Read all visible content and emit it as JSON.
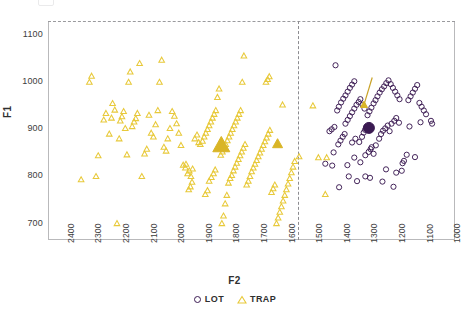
{
  "chart_data": {
    "type": "scatter",
    "title": "",
    "xlabel": "F2",
    "ylabel": "F1",
    "xlim": [
      2450,
      975
    ],
    "ylim": [
      1130,
      665
    ],
    "x_inverted": true,
    "y_inverted": true,
    "grid": false,
    "legend_position": "bottom-center",
    "xticks": [
      2400,
      2300,
      2200,
      2100,
      2000,
      1900,
      1800,
      1700,
      1600,
      1500,
      1400,
      1300,
      1200,
      1100,
      1000
    ],
    "yticks": [
      700,
      800,
      900,
      1000,
      1100
    ],
    "annotations": [
      {
        "name": "vertical-divider",
        "type": "vline",
        "x": 1545,
        "style": "dashed"
      },
      {
        "name": "centroid-arrow",
        "type": "arrow",
        "from": [
          1275,
          1010
        ],
        "to": [
          1305,
          952
        ],
        "color": "#C9A227"
      }
    ],
    "series": [
      {
        "name": "LOT",
        "marker": "circle-open",
        "color": "#3B1A52",
        "points": [
          [
            1395,
            777
          ],
          [
            1330,
            790
          ],
          [
            1360,
            800
          ],
          [
            1420,
            823
          ],
          [
            1445,
            827
          ],
          [
            1283,
            797
          ],
          [
            1300,
            800
          ],
          [
            1238,
            789
          ],
          [
            1225,
            815
          ],
          [
            1198,
            778
          ],
          [
            1188,
            808
          ],
          [
            1168,
            812
          ],
          [
            1165,
            828
          ],
          [
            1160,
            833
          ],
          [
            1150,
            846
          ],
          [
            1120,
            841
          ],
          [
            1365,
            824
          ],
          [
            1340,
            840
          ],
          [
            1318,
            830
          ],
          [
            1300,
            845
          ],
          [
            1288,
            852
          ],
          [
            1281,
            858
          ],
          [
            1277,
            862
          ],
          [
            1270,
            848
          ],
          [
            1262,
            866
          ],
          [
            1415,
            851
          ],
          [
            1398,
            868
          ],
          [
            1390,
            876
          ],
          [
            1382,
            884
          ],
          [
            1375,
            890
          ],
          [
            1430,
            896
          ],
          [
            1422,
            900
          ],
          [
            1412,
            905
          ],
          [
            1348,
            872
          ],
          [
            1336,
            880
          ],
          [
            1322,
            873
          ],
          [
            1312,
            884
          ],
          [
            1306,
            893
          ],
          [
            1301,
            899
          ],
          [
            1296,
            905
          ],
          [
            1250,
            880
          ],
          [
            1243,
            890
          ],
          [
            1236,
            897
          ],
          [
            1228,
            902
          ],
          [
            1219,
            908
          ],
          [
            1212,
            896
          ],
          [
            1205,
            912
          ],
          [
            1195,
            918
          ],
          [
            1188,
            924
          ],
          [
            1178,
            914
          ],
          [
            1140,
            906
          ],
          [
            1100,
            915
          ],
          [
            1062,
            918
          ],
          [
            1058,
            912
          ],
          [
            1372,
            912
          ],
          [
            1364,
            920
          ],
          [
            1356,
            928
          ],
          [
            1348,
            936
          ],
          [
            1340,
            944
          ],
          [
            1332,
            952
          ],
          [
            1324,
            958
          ],
          [
            1318,
            964
          ],
          [
            1310,
            952
          ],
          [
            1303,
            944
          ],
          [
            1292,
            930
          ],
          [
            1285,
            938
          ],
          [
            1278,
            946
          ],
          [
            1270,
            955
          ],
          [
            1263,
            962
          ],
          [
            1256,
            970
          ],
          [
            1248,
            978
          ],
          [
            1240,
            985
          ],
          [
            1232,
            991
          ],
          [
            1224,
            998
          ],
          [
            1216,
            1004
          ],
          [
            1208,
            996
          ],
          [
            1200,
            988
          ],
          [
            1192,
            980
          ],
          [
            1184,
            972
          ],
          [
            1176,
            964
          ],
          [
            1402,
            940
          ],
          [
            1396,
            948
          ],
          [
            1388,
            957
          ],
          [
            1380,
            965
          ],
          [
            1372,
            972
          ],
          [
            1364,
            980
          ],
          [
            1356,
            988
          ],
          [
            1348,
            995
          ],
          [
            1340,
            1002
          ],
          [
            1144,
            962
          ],
          [
            1136,
            970
          ],
          [
            1128,
            978
          ],
          [
            1120,
            986
          ],
          [
            1112,
            994
          ],
          [
            1104,
            956
          ],
          [
            1096,
            948
          ],
          [
            1088,
            940
          ],
          [
            1080,
            932
          ],
          [
            1408,
            1036
          ]
        ],
        "centroid": {
          "x": 1287,
          "y": 903,
          "marker": "circle-filled",
          "size": 11
        }
      },
      {
        "name": "TRAP",
        "marker": "triangle-open",
        "color": "#E8C93A",
        "points": [
          [
            2330,
            793
          ],
          [
            2300,
            1000
          ],
          [
            2292,
            1013
          ],
          [
            2276,
            800
          ],
          [
            2268,
            844
          ],
          [
            2248,
            920
          ],
          [
            2240,
            934
          ],
          [
            2228,
            890
          ],
          [
            2220,
            924
          ],
          [
            2216,
            955
          ],
          [
            2208,
            941
          ],
          [
            2200,
            700
          ],
          [
            2192,
            880
          ],
          [
            2188,
            918
          ],
          [
            2182,
            927
          ],
          [
            2176,
            938
          ],
          [
            2170,
            902
          ],
          [
            2164,
            846
          ],
          [
            2158,
            1000
          ],
          [
            2152,
            1022
          ],
          [
            2145,
            906
          ],
          [
            2138,
            916
          ],
          [
            2132,
            923
          ],
          [
            2126,
            934
          ],
          [
            2118,
            1040
          ],
          [
            2110,
            800
          ],
          [
            2100,
            848
          ],
          [
            2092,
            858
          ],
          [
            2084,
            930
          ],
          [
            2076,
            892
          ],
          [
            2068,
            884
          ],
          [
            2060,
            910
          ],
          [
            2052,
            940
          ],
          [
            2046,
            1000
          ],
          [
            2038,
            1047
          ],
          [
            2030,
            862
          ],
          [
            2022,
            854
          ],
          [
            2016,
            880
          ],
          [
            2008,
            902
          ],
          [
            2000,
            938
          ],
          [
            1992,
            928
          ],
          [
            1984,
            912
          ],
          [
            1976,
            892
          ],
          [
            1968,
            866
          ],
          [
            1960,
            824
          ],
          [
            1952,
            818
          ],
          [
            1944,
            806
          ],
          [
            1938,
            812
          ],
          [
            1932,
            800
          ],
          [
            1926,
            816
          ],
          [
            1918,
            880
          ],
          [
            1910,
            888
          ],
          [
            1904,
            872
          ],
          [
            1898,
            868
          ],
          [
            1890,
            875
          ],
          [
            1884,
            884
          ],
          [
            1878,
            892
          ],
          [
            1872,
            900
          ],
          [
            1866,
            908
          ],
          [
            1860,
            916
          ],
          [
            1854,
            924
          ],
          [
            1848,
            932
          ],
          [
            1842,
            940
          ],
          [
            1836,
            968
          ],
          [
            1830,
            986
          ],
          [
            1824,
            845
          ],
          [
            1818,
            852
          ],
          [
            1812,
            860
          ],
          [
            1806,
            868
          ],
          [
            1800,
            876
          ],
          [
            1794,
            884
          ],
          [
            1788,
            892
          ],
          [
            1782,
            900
          ],
          [
            1776,
            908
          ],
          [
            1770,
            916
          ],
          [
            1764,
            924
          ],
          [
            1758,
            932
          ],
          [
            1752,
            940
          ],
          [
            1746,
            1000
          ],
          [
            1740,
            1056
          ],
          [
            1950,
            826
          ],
          [
            1940,
            772
          ],
          [
            1934,
            778
          ],
          [
            1928,
            788
          ],
          [
            1880,
            762
          ],
          [
            1872,
            770
          ],
          [
            1866,
            790
          ],
          [
            1858,
            798
          ],
          [
            1850,
            806
          ],
          [
            1844,
            814
          ],
          [
            1820,
            700
          ],
          [
            1814,
            716
          ],
          [
            1808,
            742
          ],
          [
            1802,
            760
          ],
          [
            1796,
            786
          ],
          [
            1790,
            796
          ],
          [
            1784,
            802
          ],
          [
            1778,
            812
          ],
          [
            1772,
            820
          ],
          [
            1766,
            828
          ],
          [
            1760,
            836
          ],
          [
            1754,
            844
          ],
          [
            1748,
            852
          ],
          [
            1742,
            860
          ],
          [
            1736,
            868
          ],
          [
            1730,
            782
          ],
          [
            1724,
            790
          ],
          [
            1718,
            800
          ],
          [
            1712,
            810
          ],
          [
            1706,
            818
          ],
          [
            1700,
            826
          ],
          [
            1694,
            834
          ],
          [
            1688,
            842
          ],
          [
            1682,
            850
          ],
          [
            1676,
            858
          ],
          [
            1670,
            866
          ],
          [
            1664,
            874
          ],
          [
            1658,
            882
          ],
          [
            1652,
            890
          ],
          [
            1646,
            898
          ],
          [
            1640,
            766
          ],
          [
            1634,
            774
          ],
          [
            1628,
            782
          ],
          [
            1622,
            700
          ],
          [
            1616,
            712
          ],
          [
            1610,
            724
          ],
          [
            1604,
            736
          ],
          [
            1598,
            748
          ],
          [
            1592,
            760
          ],
          [
            1586,
            772
          ],
          [
            1580,
            784
          ],
          [
            1574,
            796
          ],
          [
            1568,
            808
          ],
          [
            1562,
            820
          ],
          [
            1556,
            832
          ],
          [
            1660,
            1000
          ],
          [
            1654,
            1006
          ],
          [
            1648,
            1012
          ],
          [
            1600,
            952
          ],
          [
            1540,
            842
          ],
          [
            1490,
            950
          ],
          [
            1470,
            840
          ],
          [
            1445,
            762
          ],
          [
            1440,
            840
          ]
        ],
        "centroids": [
          {
            "x": 1822,
            "y": 866,
            "marker": "triangle-filled",
            "size": 17
          },
          {
            "x": 1618,
            "y": 869,
            "marker": "triangle-filled",
            "size": 10
          },
          {
            "x": 1305,
            "y": 952,
            "marker": "triangle-filled",
            "size": 7
          }
        ]
      }
    ]
  },
  "legend": {
    "items": [
      {
        "label": "LOT",
        "marker": "circle-open-icon",
        "color": "#3B1A52"
      },
      {
        "label": "TRAP",
        "marker": "triangle-open-icon",
        "color": "#E8C93A"
      }
    ]
  },
  "axis": {
    "x_title": "F2",
    "y_title": "F1"
  },
  "colors": {
    "lot": "#3B1A52",
    "trap": "#E8C93A",
    "trap_fill": "#D9B526",
    "arrow": "#C9A227",
    "frame": "#b9b9bb",
    "text": "#3a3a3a"
  }
}
